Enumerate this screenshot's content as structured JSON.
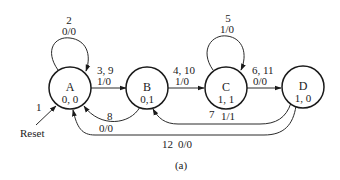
{
  "diagram": {
    "type": "state-diagram",
    "caption": "(a)",
    "reset_label": "Reset",
    "reset_number": "1",
    "states": [
      {
        "id": "A",
        "name": "A",
        "output": "0, 0"
      },
      {
        "id": "B",
        "name": "B",
        "output": "0,1"
      },
      {
        "id": "C",
        "name": "C",
        "output": "1, 1"
      },
      {
        "id": "D",
        "name": "D",
        "output": "1, 0"
      }
    ],
    "transitions": [
      {
        "from": "A",
        "to": "A",
        "number": "2",
        "label": "0/0"
      },
      {
        "from": "A",
        "to": "B",
        "number": "3, 9",
        "label": "1/0"
      },
      {
        "from": "B",
        "to": "A",
        "number": "8",
        "label": "0/0"
      },
      {
        "from": "B",
        "to": "C",
        "number": "4, 10",
        "label": "1/0"
      },
      {
        "from": "C",
        "to": "C",
        "number": "5",
        "label": "1/0"
      },
      {
        "from": "C",
        "to": "D",
        "number": "6, 11",
        "label": "0/0"
      },
      {
        "from": "D",
        "to": "B",
        "number": "7",
        "label": "1/1"
      },
      {
        "from": "D",
        "to": "A",
        "number": "12",
        "label": "0/0"
      }
    ]
  }
}
